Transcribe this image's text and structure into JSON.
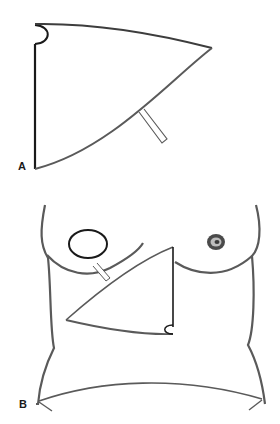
{
  "figure": {
    "panels": [
      {
        "label": "A",
        "description": "Isolated flap outline: triangular flap with curved lower border, small semicircular notch at the top-left corner, and a drain tube exiting the curved border"
      },
      {
        "label": "B",
        "description": "Female torso outline with flap drawn on the upper abdomen below the right breast; the right breast shows a circular defect, the left breast shows the nipple-areola complex; a drain crosses from the flap toward the inframammary fold; lower abdominal transverse line near the iliac crests"
      }
    ],
    "colors": {
      "stroke_dark": "#1a1a1a",
      "stroke_gray": "#5a5a5a",
      "background": "#ffffff"
    }
  }
}
